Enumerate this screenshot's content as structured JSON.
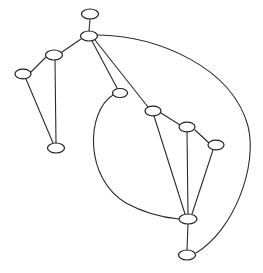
{
  "figure": {
    "background_color": "#ffffff",
    "edge_color": "#2b2b2b",
    "node_fill_color": "#ffffff",
    "node_stroke_color": "#1f1f1f",
    "width": 263,
    "height": 273
  },
  "chart_data": {
    "type": "diagram",
    "layout": "node-link graph with elliptical nodes and straight plus curved edges",
    "title": "",
    "xlabel": "",
    "ylabel": "",
    "grid": false,
    "legend": null,
    "node_count": 11,
    "edge_count": 14,
    "nodes": [
      {
        "id": "n1",
        "label": "",
        "x": 90,
        "y": 14,
        "rx": 8.5,
        "ry": 5.0
      },
      {
        "id": "n2",
        "label": "",
        "x": 89,
        "y": 36,
        "rx": 8.5,
        "ry": 5.0
      },
      {
        "id": "n3",
        "label": "",
        "x": 54,
        "y": 55,
        "rx": 8.5,
        "ry": 5.0
      },
      {
        "id": "n4",
        "label": "",
        "x": 23,
        "y": 74,
        "rx": 8.0,
        "ry": 4.8
      },
      {
        "id": "n5",
        "label": "",
        "x": 56,
        "y": 148,
        "rx": 8.5,
        "ry": 5.0
      },
      {
        "id": "n6",
        "label": "",
        "x": 120,
        "y": 93,
        "rx": 7.5,
        "ry": 4.5
      },
      {
        "id": "n7",
        "label": "",
        "x": 153,
        "y": 111,
        "rx": 8.0,
        "ry": 4.8
      },
      {
        "id": "n8",
        "label": "",
        "x": 187,
        "y": 127,
        "rx": 8.0,
        "ry": 4.8
      },
      {
        "id": "n9",
        "label": "",
        "x": 216,
        "y": 145,
        "rx": 8.0,
        "ry": 4.8
      },
      {
        "id": "n10",
        "label": "",
        "x": 188,
        "y": 219,
        "rx": 9.0,
        "ry": 5.0
      },
      {
        "id": "n11",
        "label": "",
        "x": 187,
        "y": 255,
        "rx": 8.5,
        "ry": 5.0
      }
    ],
    "edges": [
      {
        "from": "n1",
        "to": "n2",
        "kind": "straight",
        "path": "M 90 19 L 89 31"
      },
      {
        "from": "n2",
        "to": "n3",
        "kind": "straight",
        "path": "M 81 39 L 62 52"
      },
      {
        "from": "n3",
        "to": "n4",
        "kind": "straight",
        "path": "M 46 57 L 31 72"
      },
      {
        "from": "n3",
        "to": "n5",
        "kind": "straight",
        "path": "M 55 60 L 56 143"
      },
      {
        "from": "n4",
        "to": "n5",
        "kind": "straight",
        "path": "M 26 79 L 53 143"
      },
      {
        "from": "n2",
        "to": "n6",
        "kind": "straight",
        "path": "M 92 41 L 117 88"
      },
      {
        "from": "n2",
        "to": "n7",
        "kind": "straight",
        "path": "M 95 40 L 148 107"
      },
      {
        "from": "n6",
        "to": "n10",
        "kind": "curved",
        "path": "M 113 95 C 86 112 84 178 126 203 C 146 214 168 218 179 219"
      },
      {
        "from": "n7",
        "to": "n8",
        "kind": "straight",
        "path": "M 161 113 L 180 125"
      },
      {
        "from": "n7",
        "to": "n10",
        "kind": "straight",
        "path": "M 154 116 L 185 214"
      },
      {
        "from": "n8",
        "to": "n9",
        "kind": "straight",
        "path": "M 195 130 L 209 143"
      },
      {
        "from": "n8",
        "to": "n10",
        "kind": "straight",
        "path": "M 187 132 L 188 214"
      },
      {
        "from": "n9",
        "to": "n10",
        "kind": "straight",
        "path": "M 213 150 L 192 214"
      },
      {
        "from": "n10",
        "to": "n11",
        "kind": "straight",
        "path": "M 188 224 L 187 250"
      },
      {
        "from": "n2",
        "to": "n11",
        "kind": "curved",
        "path": "M 97 35 C 160 36 232 68 248 126 C 258 166 234 230 196 253"
      }
    ]
  }
}
